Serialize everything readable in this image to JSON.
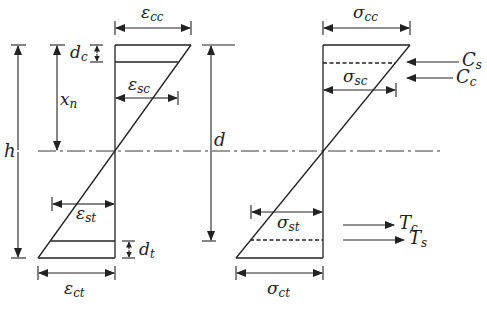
{
  "figure": {
    "type": "strain and stress distribution across a reinforced concrete section",
    "colors": {
      "line": "#222222",
      "background": "#ffffff"
    }
  },
  "dimensions": {
    "h": {
      "symbol": "h"
    },
    "xn": {
      "symbol": "x",
      "sub": "n"
    },
    "d": {
      "symbol": "d"
    },
    "dc": {
      "symbol": "d",
      "sub": "c"
    },
    "dt": {
      "symbol": "d",
      "sub": "t"
    }
  },
  "strain_diagram": {
    "eps_cc": {
      "symbol": "ε",
      "sub": "cc"
    },
    "eps_sc": {
      "symbol": "ε",
      "sub": "sc"
    },
    "eps_st": {
      "symbol": "ε",
      "sub": "st"
    },
    "eps_ct": {
      "symbol": "ε",
      "sub": "ct"
    }
  },
  "stress_diagram": {
    "sig_cc": {
      "symbol": "σ",
      "sub": "cc"
    },
    "sig_sc": {
      "symbol": "σ",
      "sub": "sc"
    },
    "sig_st": {
      "symbol": "σ",
      "sub": "st"
    },
    "sig_ct": {
      "symbol": "σ",
      "sub": "ct"
    }
  },
  "forces": {
    "Cs": {
      "symbol": "C",
      "sub": "s"
    },
    "Cc": {
      "symbol": "C",
      "sub": "c"
    },
    "Tc": {
      "symbol": "T",
      "sub": "c"
    },
    "Ts": {
      "symbol": "T",
      "sub": "s"
    }
  }
}
